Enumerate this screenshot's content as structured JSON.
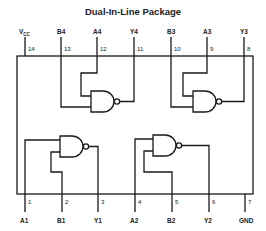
{
  "title": "Dual-In-Line Package",
  "top_pins": [
    {
      "number": "14",
      "label": "VCC"
    },
    {
      "number": "13",
      "label": "B4"
    },
    {
      "number": "12",
      "label": "A4"
    },
    {
      "number": "11",
      "label": "Y4"
    },
    {
      "number": "10",
      "label": "B3"
    },
    {
      "number": "9",
      "label": "A3"
    },
    {
      "number": "8",
      "label": "Y3"
    }
  ],
  "bottom_pins": [
    {
      "number": "1",
      "label": "A1"
    },
    {
      "number": "2",
      "label": "B1"
    },
    {
      "number": "3",
      "label": "Y1"
    },
    {
      "number": "4",
      "label": "A2"
    },
    {
      "number": "5",
      "label": "B2"
    },
    {
      "number": "6",
      "label": "Y2"
    },
    {
      "number": "7",
      "label": "GND"
    }
  ],
  "vcc": {
    "main": "V",
    "sub": "CC"
  },
  "gates": [
    {
      "id": "gate-4",
      "type": "NAND",
      "inputs": [
        "A4",
        "B4"
      ],
      "output": "Y4"
    },
    {
      "id": "gate-3",
      "type": "NAND",
      "inputs": [
        "A3",
        "B3"
      ],
      "output": "Y3"
    },
    {
      "id": "gate-1",
      "type": "NAND",
      "inputs": [
        "A1",
        "B1"
      ],
      "output": "Y1"
    },
    {
      "id": "gate-2",
      "type": "NAND",
      "inputs": [
        "A2",
        "B2"
      ],
      "output": "Y2"
    }
  ],
  "colors": {
    "line": "#1a1a1a",
    "background": "#ffffff"
  }
}
